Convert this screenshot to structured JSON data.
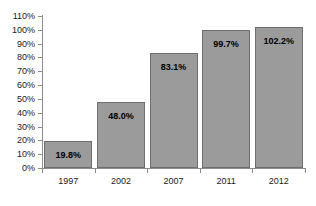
{
  "chart_data": {
    "type": "bar",
    "title": "",
    "xlabel": "",
    "ylabel": "",
    "categories": [
      "1997",
      "2002",
      "2007",
      "2011",
      "2012"
    ],
    "values": [
      19.8,
      48.0,
      83.1,
      99.7,
      102.2
    ],
    "value_labels": [
      "19.8%",
      "48.0%",
      "83.1%",
      "99.7%",
      "102.2%"
    ],
    "ylim": [
      0,
      110
    ],
    "ytick_step": 10,
    "ytick_labels": [
      "0%",
      "10%",
      "20%",
      "30%",
      "40%",
      "50%",
      "60%",
      "70%",
      "80%",
      "90%",
      "100%",
      "110%"
    ],
    "ytick_values": [
      0,
      10,
      20,
      30,
      40,
      50,
      60,
      70,
      80,
      90,
      100,
      110
    ],
    "grid": false,
    "legend": false,
    "legend_position": "none",
    "series": [
      {
        "name": "",
        "values": [
          19.8,
          48.0,
          83.1,
          99.7,
          102.2
        ]
      }
    ],
    "colors": {
      "bar_fill": "#9b9b9b",
      "bar_border": "#6d6d6d",
      "axis": "#8c8c8c",
      "text": "#1a1a1a",
      "value_text": "#000000",
      "background": "#ffffff"
    }
  }
}
